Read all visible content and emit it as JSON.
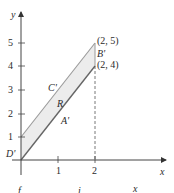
{
  "diagram": {
    "type": "coordinate-plane-region",
    "axes": {
      "x_label": "x",
      "y_label": "y",
      "x_ticks": [
        "1",
        "2"
      ],
      "y_ticks": [
        "1",
        "2",
        "3",
        "4",
        "5"
      ]
    },
    "region": {
      "label": "R",
      "fill": "#ececec",
      "stroke": "#8a8a8a",
      "vertices": [
        {
          "name": "D'",
          "coord": [
            0,
            0
          ]
        },
        {
          "name": "A'",
          "coord": [
            2,
            4
          ]
        },
        {
          "name": "B'",
          "coord": [
            2,
            5
          ]
        },
        {
          "name": "C'",
          "coord": [
            0,
            1
          ]
        }
      ],
      "side_labels": {
        "bottom": "A'",
        "right": "B'",
        "top": "C'",
        "origin": "D'"
      }
    },
    "point_labels": {
      "top_right": "(2, 5)",
      "bottom_right": "(2, 4)"
    },
    "dashed_line": {
      "x": 2,
      "from_y": 0,
      "to_y": 4
    },
    "caption_fragment": [
      "f",
      "i",
      "x"
    ]
  }
}
